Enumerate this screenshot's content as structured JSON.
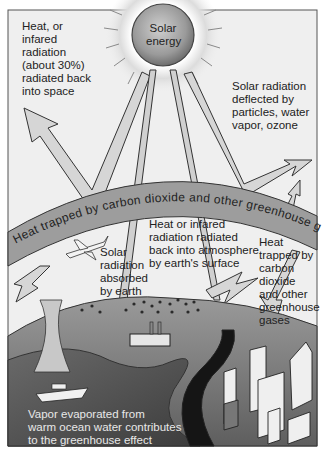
{
  "diagram": {
    "title": "Greenhouse effect",
    "sun": {
      "label": "Solar\nenergy"
    },
    "band": {
      "label": "Heat trapped by carbon dioxide and other greenhouse gases"
    },
    "labels": {
      "radiated_back": "Heat, or\ninfared\nradiation\n(about 30%)\nradiated back\ninto space",
      "deflected": "Solar radiation\ndeflected by\nparticles, water\nvapor, ozone",
      "absorbed": "Solar\nradiation\nabsorbed\nby earth",
      "reradiated": "Heat or infared\nradiation radiated\nback into atmosphere\nby earth's surface",
      "trapped": "Heat\ntrapped by\ncarbon\ndioxide\nand other\ngreenhouse\ngases",
      "vapor": "Vapor evaporated from\nwarm ocean water contributes\nto the greenhouse effect"
    },
    "colors": {
      "frame": "#555555",
      "sky": "#efefef",
      "sun_core": "#9a9a9a",
      "band": "#9d9d9d",
      "arrow_fill": "#d4d4d4",
      "land": "#7c7c7c",
      "ocean": "#5a5a5a",
      "road": "#151515"
    }
  }
}
